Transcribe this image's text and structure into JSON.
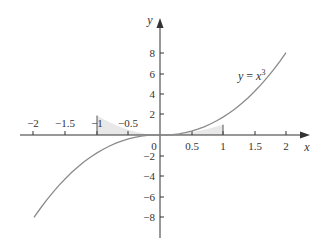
{
  "figure": {
    "curve_label": "y = x³",
    "curve_label_parts": {
      "lhs": "y",
      "eq": " = ",
      "base": "x",
      "exp": "3"
    },
    "x_axis_label": "x",
    "y_axis_label": "y",
    "origin_label": "0",
    "x_ticks_above": [
      "−2",
      "−1.5",
      "−1",
      "−0.5"
    ],
    "x_ticks_below": [
      "0.5",
      "1",
      "1.5",
      "2"
    ],
    "y_ticks_positive": [
      "8",
      "6",
      "4",
      "2"
    ],
    "y_ticks_negative": [
      "−2",
      "−4",
      "−6",
      "−8"
    ],
    "shaded_regions": [
      {
        "from": -1,
        "to": 0,
        "description": "area between y=x^3 and x-axis"
      },
      {
        "from": 0,
        "to": 1,
        "description": "area between y=x^3 and x-axis"
      }
    ],
    "colors": {
      "axis": "#333333",
      "curve": "#8a8a8a",
      "shade": "#e8e8e8"
    }
  }
}
